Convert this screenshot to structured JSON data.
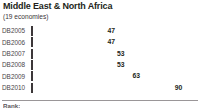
{
  "header": {
    "title": "Middle East & North Africa",
    "subtitle": "(19 economies)"
  },
  "footer": {
    "caption": "Rank:"
  },
  "chart_data": {
    "type": "bar",
    "orientation": "horizontal",
    "title": "Middle East & North Africa",
    "subtitle": "(19 economies)",
    "xlabel": "",
    "ylabel": "",
    "xlim": [
      0,
      100
    ],
    "grid": false,
    "legend": "none",
    "categories": [
      "DB2005",
      "DB2006",
      "DB2007",
      "DB2008",
      "DB2009",
      "DB2010"
    ],
    "values": [
      47,
      47,
      53,
      53,
      63,
      90
    ],
    "bar_colors": [
      "#ffffff",
      "#e8e8e8",
      "#cfcfcf",
      "#b4b4b4",
      "#8f8f8f",
      "#221f20"
    ],
    "bar_outline_color": "#3c3739",
    "bars": [
      {
        "label": "DB2005",
        "value": 47,
        "fill": "#ffffff"
      },
      {
        "label": "DB2006",
        "value": 47,
        "fill": "#e8e8e8"
      },
      {
        "label": "DB2007",
        "value": 53,
        "fill": "#cfcfcf"
      },
      {
        "label": "DB2008",
        "value": 53,
        "fill": "#b4b4b4"
      },
      {
        "label": "DB2009",
        "value": 63,
        "fill": "#8f8f8f"
      },
      {
        "label": "DB2010",
        "value": 90,
        "fill": "#221f20"
      }
    ]
  }
}
